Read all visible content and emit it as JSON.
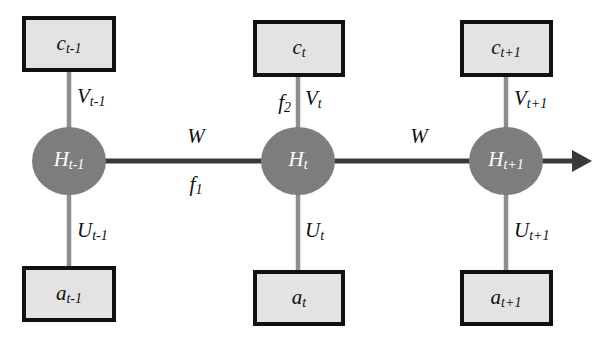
{
  "diagram": {
    "colors": {
      "box_fill": "#e3e3e3",
      "box_stroke": "#111111",
      "node_fill": "#7d7d7d",
      "node_text": "#ffffff",
      "vertical_edge": "#8d8d8d",
      "horizontal_edge": "#3a3a3a",
      "background": "#ffffff"
    },
    "time_slices": [
      {
        "index": "t-1",
        "top_box": {
          "base": "c",
          "subscript": "t-1"
        },
        "node": {
          "base": "H",
          "subscript": "t-1"
        },
        "bottom_box": {
          "base": "a",
          "subscript": "t-1"
        },
        "top_edge_label": {
          "base": "V",
          "subscript": "t-1"
        },
        "bottom_edge_label": {
          "base": "U",
          "subscript": "t-1"
        }
      },
      {
        "index": "t",
        "top_box": {
          "base": "c",
          "subscript": "t"
        },
        "node": {
          "base": "H",
          "subscript": "t"
        },
        "bottom_box": {
          "base": "a",
          "subscript": "t"
        },
        "top_edge_label": {
          "base": "V",
          "subscript": "t"
        },
        "bottom_edge_label": {
          "base": "U",
          "subscript": "t"
        }
      },
      {
        "index": "t+1",
        "top_box": {
          "base": "c",
          "subscript": "t+1"
        },
        "node": {
          "base": "H",
          "subscript": "t+1"
        },
        "bottom_box": {
          "base": "a",
          "subscript": "t+1"
        },
        "top_edge_label": {
          "base": "V",
          "subscript": "t+1"
        },
        "bottom_edge_label": {
          "base": "U",
          "subscript": "t+1"
        }
      }
    ],
    "recurrent_edges": [
      {
        "label": "W",
        "from": "H_t-1",
        "to": "H_t"
      },
      {
        "label": "W",
        "from": "H_t",
        "to": "H_t+1"
      }
    ],
    "function_labels": [
      {
        "base": "f",
        "subscript": "1",
        "note": "below first recurrent edge"
      },
      {
        "base": "f",
        "subscript": "2",
        "note": "left of second slice upward edge"
      }
    ]
  }
}
